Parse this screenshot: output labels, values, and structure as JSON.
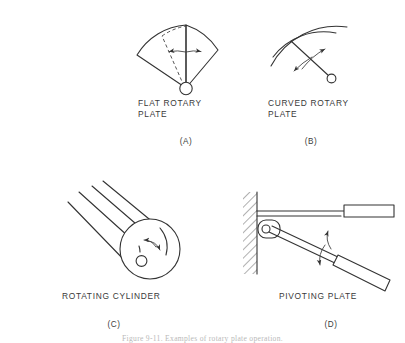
{
  "figure": {
    "background_color": "#ffffff",
    "line_color": "#333333",
    "caption": "Figure 9-11.  Examples of rotary plate operation."
  },
  "panels": [
    {
      "id": "A",
      "letter": "(A)",
      "title": "FLAT ROTARY\nPLATE",
      "mechanism": "flat-rotary-plate",
      "elements": [
        "pivot-circle",
        "sector-outline",
        "dashed-alternate-position",
        "double-headed-rotation-arrow"
      ]
    },
    {
      "id": "B",
      "letter": "(B)",
      "title": "CURVED ROTARY\nPLATE",
      "mechanism": "curved-rotary-plate",
      "elements": [
        "outer-arc",
        "inner-arc",
        "pivot-arm",
        "pivot-circle",
        "curved-double-headed-arrow"
      ]
    },
    {
      "id": "C",
      "letter": "(C)",
      "title": "ROTATING CYLINDER",
      "mechanism": "rotating-cylinder",
      "elements": [
        "cylinder-body-lines",
        "cylinder-end-circle",
        "shaft-circle",
        "curved-double-headed-arrow"
      ]
    },
    {
      "id": "D",
      "letter": "(D)",
      "title": "PIVOTING PLATE",
      "mechanism": "pivoting-plate",
      "elements": [
        "hatched-wall",
        "pivot-bracket",
        "pivot-hole",
        "upper-plate",
        "lower-plate",
        "curved-double-headed-arrow"
      ]
    }
  ]
}
